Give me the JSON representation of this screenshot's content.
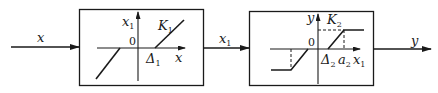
{
  "diagram": {
    "type": "block-diagram-nonlinear-chain",
    "input_signal": {
      "label": "x"
    },
    "intermediate_signal": {
      "label": "x",
      "sub": "1"
    },
    "output_signal": {
      "label": "y"
    },
    "blocks": [
      {
        "name": "dead-zone",
        "y_axis": {
          "label": "x",
          "sub": "1"
        },
        "x_axis": {
          "label": "x"
        },
        "origin": "0",
        "threshold": {
          "label": "Δ",
          "sub": "1"
        },
        "slope": {
          "label": "K",
          "sub": "1"
        }
      },
      {
        "name": "dead-zone-saturation",
        "y_axis": {
          "label": "y"
        },
        "x_axis": {
          "label": "x",
          "sub": "1"
        },
        "origin": "0",
        "threshold": {
          "label": "Δ",
          "sub": "2"
        },
        "saturation": {
          "label": "a",
          "sub": "2"
        },
        "slope": {
          "label": "K",
          "sub": "2"
        }
      }
    ]
  },
  "colors": {
    "line": "#1a1a1a",
    "background": "#ffffff"
  }
}
